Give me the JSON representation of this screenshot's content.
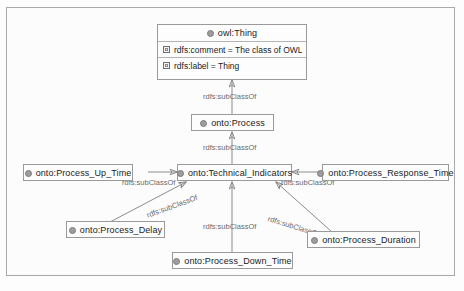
{
  "diagram": {
    "type": "ontology-class-hierarchy",
    "frame_color": "#a9a9a9",
    "edge_color": "#8c8c8c",
    "label_color": "#6b6b6b",
    "node_border_color": "#9a9a9a",
    "class_icon_color": "#9d9d9d"
  },
  "nodes": [
    {
      "id": "owl-thing",
      "title": "owl:Thing",
      "icon": "class-circle-icon",
      "attributes": [
        {
          "icon": "property-square-icon",
          "text": "rdfs:comment = The class of OWL ind..."
        },
        {
          "icon": "property-square-icon",
          "text": "rdfs:label = Thing"
        }
      ]
    },
    {
      "id": "onto-process",
      "title": "onto:Process",
      "icon": "class-circle-icon",
      "attributes": []
    },
    {
      "id": "onto-technical-indicators",
      "title": "onto:Technical_Indicators",
      "icon": "class-circle-icon",
      "attributes": []
    },
    {
      "id": "onto-process-up-time",
      "title": "onto:Process_Up_Time",
      "icon": "class-circle-icon",
      "attributes": []
    },
    {
      "id": "onto-process-response-time",
      "title": "onto:Process_Response_Time",
      "icon": "class-circle-icon",
      "attributes": []
    },
    {
      "id": "onto-process-delay",
      "title": "onto:Process_Delay",
      "icon": "class-circle-icon",
      "attributes": []
    },
    {
      "id": "onto-process-duration",
      "title": "onto:Process_Duration",
      "icon": "class-circle-icon",
      "attributes": []
    },
    {
      "id": "onto-process-down-time",
      "title": "onto:Process_Down_Time",
      "icon": "class-circle-icon",
      "attributes": []
    }
  ],
  "edges": [
    {
      "id": "e1",
      "from": "onto-process",
      "to": "owl-thing",
      "label": "rdfs:subClassOf"
    },
    {
      "id": "e2",
      "from": "onto-technical-indicators",
      "to": "onto-process",
      "label": "rdfs:subClassOf"
    },
    {
      "id": "e3",
      "from": "onto-process-up-time",
      "to": "onto-technical-indicators",
      "label": "rdfs:subClassOf"
    },
    {
      "id": "e4",
      "from": "onto-process-response-time",
      "to": "onto-technical-indicators",
      "label": "rdfs:subClassOf"
    },
    {
      "id": "e5",
      "from": "onto-process-delay",
      "to": "onto-technical-indicators",
      "label": "rdfs:subClassOf"
    },
    {
      "id": "e6",
      "from": "onto-process-duration",
      "to": "onto-technical-indicators",
      "label": "rdfs:subClassOf"
    },
    {
      "id": "e7",
      "from": "onto-process-down-time",
      "to": "onto-technical-indicators",
      "label": "rdfs:subClassOf"
    }
  ]
}
